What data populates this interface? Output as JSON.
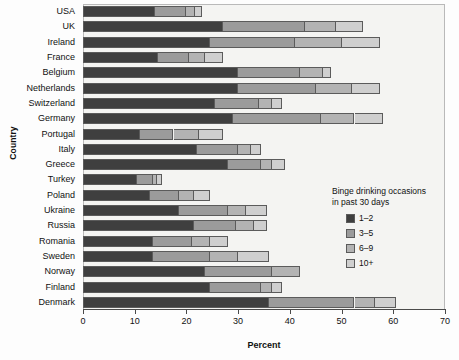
{
  "chart_data": {
    "type": "bar",
    "orientation": "horizontal",
    "stacked": true,
    "title": "",
    "xlabel": "Percent",
    "ylabel": "Country",
    "xlim": [
      0,
      70
    ],
    "xticks": [
      0,
      10,
      20,
      30,
      40,
      50,
      60,
      70
    ],
    "grid": false,
    "legend_title": "Binge drinking occasions in past 30 days",
    "legend_position": "inside-right",
    "categories": [
      "USA",
      "UK",
      "Ireland",
      "France",
      "Belgium",
      "Netherlands",
      "Switzerland",
      "Germany",
      "Portugal",
      "Italy",
      "Greece",
      "Turkey",
      "Poland",
      "Ukraine",
      "Russia",
      "Romania",
      "Sweden",
      "Norway",
      "Finland",
      "Denmark"
    ],
    "series": [
      {
        "name": "1–2",
        "color": "#3f3f3f",
        "values": [
          14.0,
          27.0,
          24.5,
          14.5,
          30.0,
          30.0,
          25.5,
          29.0,
          11.0,
          22.0,
          28.0,
          10.5,
          13.0,
          18.5,
          21.5,
          13.5,
          13.5,
          23.5,
          24.5,
          36.0
        ]
      },
      {
        "name": "3–5",
        "color": "#9b9b9b",
        "values": [
          6.0,
          16.0,
          16.5,
          6.0,
          12.0,
          15.0,
          8.5,
          17.0,
          6.5,
          8.0,
          6.5,
          3.0,
          5.5,
          9.5,
          8.0,
          7.5,
          11.0,
          13.0,
          10.0,
          16.5
        ]
      },
      {
        "name": "6–9",
        "color": "#b3b3b3",
        "values": [
          1.7,
          6.0,
          9.0,
          3.0,
          4.5,
          7.0,
          2.5,
          6.5,
          5.0,
          2.5,
          2.0,
          0.8,
          3.0,
          3.5,
          3.5,
          3.5,
          5.5,
          5.5,
          2.0,
          4.0
        ]
      },
      {
        "name": "10+",
        "color": "#cfcfcf",
        "values": [
          1.3,
          5.2,
          7.5,
          3.5,
          1.5,
          5.5,
          2.0,
          5.5,
          4.5,
          2.0,
          2.5,
          1.0,
          3.0,
          4.0,
          2.5,
          3.5,
          6.0,
          0.0,
          2.0,
          4.0
        ]
      }
    ],
    "totals": [
      23.0,
      54.2,
      57.5,
      27.0,
      48.0,
      57.5,
      38.5,
      58.0,
      27.0,
      34.5,
      39.0,
      15.3,
      24.5,
      35.5,
      35.5,
      28.0,
      36.0,
      42.0,
      38.5,
      60.5
    ]
  },
  "axis": {
    "x_title": "Percent",
    "y_title": "Country"
  },
  "legend": {
    "title_line1": "Binge drinking occasions",
    "title_line2": "in past 30 days",
    "items": [
      {
        "label": "1–2",
        "color": "#3f3f3f"
      },
      {
        "label": "3–5",
        "color": "#9b9b9b"
      },
      {
        "label": "6–9",
        "color": "#b3b3b3"
      },
      {
        "label": "10+",
        "color": "#cfcfcf"
      }
    ]
  },
  "colors": {
    "background": "#fdfdfd",
    "plot_background": "#f4f4f2",
    "frame": "#b9b9b9",
    "axis": "#4a4a4a",
    "text": "#111111",
    "segment_border": "#5b5b5b"
  }
}
